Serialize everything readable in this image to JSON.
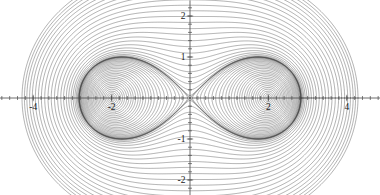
{
  "figure": {
    "name": "cassini-ovals-family",
    "background_color": "#ffffff",
    "curve_color": "#3a3a3a",
    "axis_color": "#4a4a4a",
    "label_color": "#1a1a1a"
  },
  "chart_data": {
    "type": "line",
    "title": "",
    "subtitle": "",
    "xlabel": "",
    "ylabel": "",
    "grid": false,
    "legend": false,
    "legend_position": "none",
    "xlim": [
      -4.85,
      4.85
    ],
    "ylim": [
      -2.38,
      2.38
    ],
    "x_ticks_major": [
      -4,
      -2,
      2,
      4
    ],
    "y_ticks_major": [
      -2,
      -1,
      1,
      2
    ],
    "x_tick_labels": [
      "-4",
      "-2",
      "2",
      "4"
    ],
    "y_tick_labels": [
      "-2",
      "-1",
      "1",
      "2"
    ],
    "x_minor_tick_step": 0.2,
    "y_minor_tick_step": 0.2,
    "family": "cassini-ovals",
    "equation": "(x^2 + y^2)^2 - 2*a^2*(x^2 - y^2) = b^4 - a^4",
    "focal_parameter_a": 2.0,
    "curve_count": 54,
    "level_parameter_name": "b",
    "separatrix_level": 2.0,
    "levels_inner_two_lobes": [
      0.3,
      0.46,
      0.6,
      0.72,
      0.83,
      0.93,
      1.02,
      1.1,
      1.18,
      1.25,
      1.32,
      1.38,
      1.44,
      1.5,
      1.55,
      1.6,
      1.65,
      1.7,
      1.74,
      1.78,
      1.82,
      1.855,
      1.89,
      1.92,
      1.945,
      1.967,
      1.982,
      1.993,
      1.999
    ],
    "levels_outer_single_loop": [
      2.001,
      2.01,
      2.03,
      2.06,
      2.1,
      2.15,
      2.21,
      2.28,
      2.36,
      2.44,
      2.53,
      2.62,
      2.72,
      2.82,
      2.92,
      3.02,
      3.12,
      3.22,
      3.31,
      3.4,
      3.49,
      3.57,
      3.65,
      3.72,
      3.79
    ],
    "x_axis_ticks_minor_range": [
      -4.8,
      4.8
    ],
    "y_axis_ticks_minor_range": [
      -2.2,
      2.2
    ]
  },
  "axes": {
    "origin_px": {
      "x": 190,
      "y": 98
    },
    "px_per_unit_x": 39.2,
    "px_per_unit_y": 41.0
  }
}
